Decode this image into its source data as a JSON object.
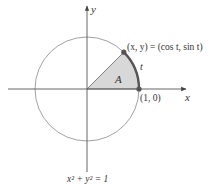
{
  "diagram": {
    "type": "unit-circle",
    "center": [
      87,
      89
    ],
    "radius": 52,
    "angle_deg": 45,
    "colors": {
      "axis": "#555555",
      "circle": "#888888",
      "sector_fill": "#d8d8d8",
      "arc_highlight": "#555555",
      "point": "#555555"
    },
    "labels": {
      "x_axis": "x",
      "y_axis": "y",
      "point_label": "(x, y) = (cos t, sin t)",
      "origin_point_label": "(1, 0)",
      "arc_label": "t",
      "area_label": "A",
      "equation": "x² + y² = 1"
    }
  }
}
